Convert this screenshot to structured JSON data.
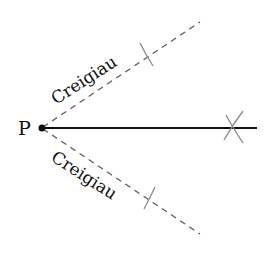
{
  "diagram": {
    "point_label": "P",
    "upper_label": "Creigiau",
    "lower_label": "Creigiau",
    "colors": {
      "line": "#111111",
      "dashed": "#555555",
      "arc": "#888888"
    }
  }
}
